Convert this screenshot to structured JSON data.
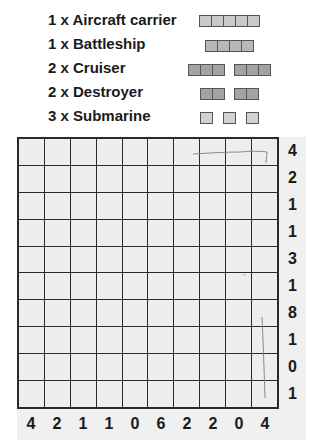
{
  "legend": [
    {
      "label": "1 x Aircraft carrier",
      "count": 1,
      "length": 5
    },
    {
      "label": "1 x Battleship",
      "count": 1,
      "length": 4
    },
    {
      "label": "2 x Cruiser",
      "count": 2,
      "length": 3
    },
    {
      "label": "2 x Destroyer",
      "count": 2,
      "length": 2
    },
    {
      "label": "3 x Submarine",
      "count": 3,
      "length": 1
    }
  ],
  "grid": {
    "rows": 10,
    "cols": 10,
    "row_clues": [
      "4",
      "2",
      "1",
      "1",
      "3",
      "1",
      "8",
      "1",
      "0",
      "1"
    ],
    "col_clues": [
      "4",
      "2",
      "1",
      "1",
      "0",
      "6",
      "2",
      "2",
      "0",
      "4"
    ]
  },
  "colors": {
    "cell_fill": "#eeeeee",
    "grid_line": "#2a2a2a",
    "clue_panel": "#f0f0f0",
    "ship_border": "#555555",
    "pencil_mark": "#8a8a8a"
  }
}
